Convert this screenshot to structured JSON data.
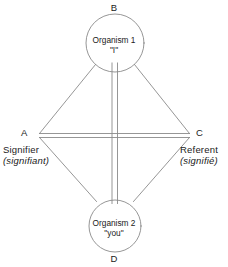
{
  "figure": {
    "type": "semiotic-diagram",
    "background_color": "#ffffff",
    "stroke_color": "#8a8a8a",
    "text_color": "#1a1a1a"
  },
  "nodes": {
    "top": {
      "corner_letter": "B",
      "line1": "Organism 1",
      "line2": "\"I\""
    },
    "bottom": {
      "corner_letter": "D",
      "line1": "Organism 2",
      "line2": "\"you\""
    }
  },
  "vertices": {
    "left": {
      "corner_letter": "A",
      "term": "Signifier",
      "term_alt": "(signifiant)"
    },
    "right": {
      "corner_letter": "C",
      "term": "Referent",
      "term_alt": "(signifié)"
    }
  },
  "edges": [
    {
      "name": "b-to-a",
      "style": "single"
    },
    {
      "name": "b-to-c",
      "style": "single"
    },
    {
      "name": "d-to-a",
      "style": "single"
    },
    {
      "name": "d-to-c",
      "style": "single"
    },
    {
      "name": "a-to-c",
      "style": "double"
    },
    {
      "name": "b-to-d",
      "style": "double"
    }
  ]
}
